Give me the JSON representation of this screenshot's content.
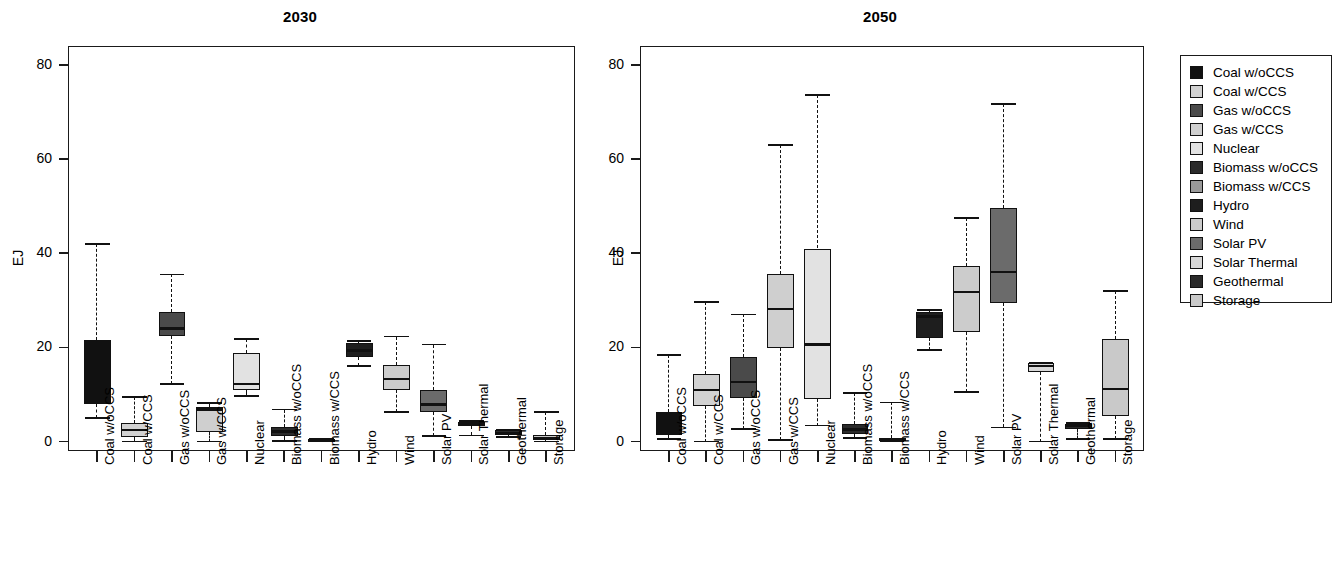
{
  "figure": {
    "ylabel": "EJ",
    "y_ticks": [
      0,
      20,
      40,
      60,
      80
    ],
    "ylim": [
      -2,
      84
    ]
  },
  "legend": {
    "title": "",
    "items": [
      {
        "label": "Coal w/oCCS",
        "color": "#111111"
      },
      {
        "label": "Coal w/CCS",
        "color": "#d2d2d2"
      },
      {
        "label": "Gas w/oCCS",
        "color": "#4a4a4a"
      },
      {
        "label": "Gas w/CCS",
        "color": "#cfcfcf"
      },
      {
        "label": "Nuclear",
        "color": "#e2e2e2"
      },
      {
        "label": "Biomass w/oCCS",
        "color": "#2b2b2b"
      },
      {
        "label": "Biomass w/CCS",
        "color": "#9a9a9a"
      },
      {
        "label": "Hydro",
        "color": "#1e1e1e"
      },
      {
        "label": "Wind",
        "color": "#cccccc"
      },
      {
        "label": "Solar PV",
        "color": "#6b6b6b"
      },
      {
        "label": "Solar Thermal",
        "color": "#d8d8d8"
      },
      {
        "label": "Geothermal",
        "color": "#2a2a2a"
      },
      {
        "label": "Storage",
        "color": "#c9c9c9"
      }
    ]
  },
  "chart_data": [
    {
      "type": "boxplot",
      "title": "2030",
      "xlabel": "",
      "ylabel": "EJ",
      "ylim": [
        -2,
        84
      ],
      "yticks": [
        0,
        20,
        40,
        60,
        80
      ],
      "grid": false,
      "categories": [
        "Coal w/oCCS",
        "Coal w/CCS",
        "Gas w/oCCS",
        "Gas w/CCS",
        "Nuclear",
        "Biomass w/oCCS",
        "Biomass w/CCS",
        "Hydro",
        "Wind",
        "Solar PV",
        "Solar Thermal",
        "Geothermal",
        "Storage"
      ],
      "boxes": [
        {
          "name": "Coal w/oCCS",
          "whisker_low": 5.0,
          "q1": 8.0,
          "median": 8.2,
          "q3": 21.5,
          "whisker_high": 42.0,
          "color": "#111111"
        },
        {
          "name": "Coal w/CCS",
          "whisker_low": 0.0,
          "q1": 1.0,
          "median": 2.4,
          "q3": 4.0,
          "whisker_high": 9.5,
          "color": "#d2d2d2"
        },
        {
          "name": "Gas w/oCCS",
          "whisker_low": 12.3,
          "q1": 22.5,
          "median": 24.0,
          "q3": 27.5,
          "whisker_high": 35.5,
          "color": "#4a4a4a"
        },
        {
          "name": "Gas w/CCS",
          "whisker_low": 0.0,
          "q1": 2.0,
          "median": 6.8,
          "q3": 7.4,
          "whisker_high": 8.2,
          "color": "#cfcfcf"
        },
        {
          "name": "Nuclear",
          "whisker_low": 9.6,
          "q1": 11.0,
          "median": 12.2,
          "q3": 18.8,
          "whisker_high": 21.7,
          "color": "#e2e2e2"
        },
        {
          "name": "Biomass w/oCCS",
          "whisker_low": 0.2,
          "q1": 1.2,
          "median": 2.1,
          "q3": 3.0,
          "whisker_high": 6.8,
          "color": "#2b2b2b"
        },
        {
          "name": "Biomass w/CCS",
          "whisker_low": 0.0,
          "q1": 0.1,
          "median": 0.3,
          "q3": 0.5,
          "whisker_high": 0.6,
          "color": "#9a9a9a"
        },
        {
          "name": "Hydro",
          "whisker_low": 16.0,
          "q1": 18.0,
          "median": 19.3,
          "q3": 21.0,
          "whisker_high": 21.4,
          "color": "#1e1e1e"
        },
        {
          "name": "Wind",
          "whisker_low": 6.2,
          "q1": 11.0,
          "median": 13.3,
          "q3": 16.3,
          "whisker_high": 22.3,
          "color": "#cccccc"
        },
        {
          "name": "Solar PV",
          "whisker_low": 1.2,
          "q1": 6.3,
          "median": 7.9,
          "q3": 11.0,
          "whisker_high": 20.6,
          "color": "#6b6b6b"
        },
        {
          "name": "Solar Thermal",
          "whisker_low": 1.3,
          "q1": 3.3,
          "median": 3.8,
          "q3": 4.2,
          "whisker_high": 4.3,
          "color": "#d8d8d8"
        },
        {
          "name": "Geothermal",
          "whisker_low": 1.0,
          "q1": 1.3,
          "median": 1.8,
          "q3": 2.4,
          "whisker_high": 2.5,
          "color": "#2a2a2a"
        },
        {
          "name": "Storage",
          "whisker_low": 0.0,
          "q1": 0.3,
          "median": 0.8,
          "q3": 1.4,
          "whisker_high": 6.3,
          "color": "#c9c9c9"
        }
      ]
    },
    {
      "type": "boxplot",
      "title": "2050",
      "xlabel": "",
      "ylabel": "EJ",
      "ylim": [
        -2,
        84
      ],
      "yticks": [
        0,
        20,
        40,
        60,
        80
      ],
      "grid": false,
      "categories": [
        "Coal w/oCCS",
        "Coal w/CCS",
        "Gas w/oCCS",
        "Gas w/CCS",
        "Nuclear",
        "Biomass w/oCCS",
        "Biomass w/CCS",
        "Hydro",
        "Wind",
        "Solar PV",
        "Solar Thermal",
        "Geothermal",
        "Storage"
      ],
      "boxes": [
        {
          "name": "Coal w/oCCS",
          "whisker_low": 0.6,
          "q1": 1.4,
          "median": 1.8,
          "q3": 6.3,
          "whisker_high": 18.4,
          "color": "#111111"
        },
        {
          "name": "Coal w/CCS",
          "whisker_low": 0.0,
          "q1": 7.6,
          "median": 11.0,
          "q3": 14.3,
          "whisker_high": 29.6,
          "color": "#d2d2d2"
        },
        {
          "name": "Gas w/oCCS",
          "whisker_low": 2.6,
          "q1": 9.2,
          "median": 12.6,
          "q3": 18.0,
          "whisker_high": 27.0,
          "color": "#4a4a4a"
        },
        {
          "name": "Gas w/CCS",
          "whisker_low": 0.3,
          "q1": 19.8,
          "median": 28.2,
          "q3": 35.6,
          "whisker_high": 63.0,
          "color": "#cfcfcf"
        },
        {
          "name": "Nuclear",
          "whisker_low": 3.4,
          "q1": 9.0,
          "median": 20.6,
          "q3": 41.0,
          "whisker_high": 73.6,
          "color": "#e2e2e2"
        },
        {
          "name": "Biomass w/oCCS",
          "whisker_low": 0.7,
          "q1": 1.7,
          "median": 2.6,
          "q3": 3.8,
          "whisker_high": 10.4,
          "color": "#2b2b2b"
        },
        {
          "name": "Biomass w/CCS",
          "whisker_low": 0.0,
          "q1": 0.2,
          "median": 0.5,
          "q3": 0.8,
          "whisker_high": 8.3,
          "color": "#9a9a9a"
        },
        {
          "name": "Hydro",
          "whisker_low": 19.4,
          "q1": 22.0,
          "median": 26.6,
          "q3": 27.6,
          "whisker_high": 28.0,
          "color": "#1e1e1e"
        },
        {
          "name": "Wind",
          "whisker_low": 10.6,
          "q1": 23.3,
          "median": 31.8,
          "q3": 37.2,
          "whisker_high": 47.4,
          "color": "#cccccc"
        },
        {
          "name": "Solar PV",
          "whisker_low": 3.0,
          "q1": 29.5,
          "median": 36.0,
          "q3": 49.5,
          "whisker_high": 71.6,
          "color": "#6b6b6b"
        },
        {
          "name": "Solar Thermal",
          "whisker_low": 0.0,
          "q1": 14.8,
          "median": 16.0,
          "q3": 16.6,
          "whisker_high": 16.8,
          "color": "#d8d8d8"
        },
        {
          "name": "Geothermal",
          "whisker_low": 0.5,
          "q1": 2.6,
          "median": 3.4,
          "q3": 3.8,
          "whisker_high": 4.0,
          "color": "#2a2a2a"
        },
        {
          "name": "Storage",
          "whisker_low": 0.6,
          "q1": 5.4,
          "median": 11.2,
          "q3": 21.8,
          "whisker_high": 32.0,
          "color": "#c9c9c9"
        }
      ]
    }
  ]
}
